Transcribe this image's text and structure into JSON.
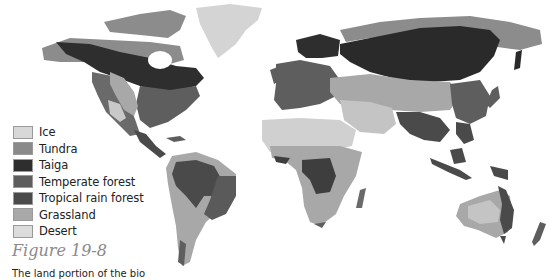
{
  "figure": {
    "title": "Figure 19-8",
    "caption": "The land portion of the bio"
  },
  "legend": {
    "items": [
      {
        "label": "Ice",
        "color": "#d8d8d8"
      },
      {
        "label": "Tundra",
        "color": "#8a8a8a"
      },
      {
        "label": "Taiga",
        "color": "#2e2e2e"
      },
      {
        "label": "Temperate forest",
        "color": "#5e5e5e"
      },
      {
        "label": "Tropical rain forest",
        "color": "#4a4a4a"
      },
      {
        "label": "Grassland",
        "color": "#a8a8a8"
      },
      {
        "label": "Desert",
        "color": "#dcdcdc"
      }
    ]
  },
  "map": {
    "description": "World map of terrestrial biomes in grayscale"
  }
}
